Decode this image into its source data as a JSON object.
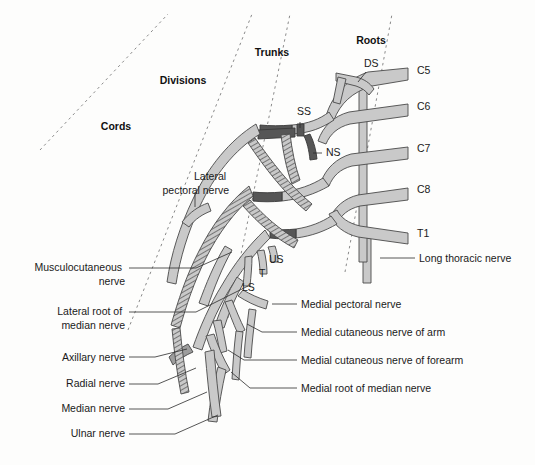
{
  "figure": {
    "colors": {
      "nerve_light": "#c9c9c9",
      "nerve_dark": "#565656",
      "nerve_mid": "#9d9d9d",
      "outline": "#4a4a4a",
      "divider": "#8a8a8a",
      "text": "#1a1a1a",
      "background": "#fdfdfc"
    }
  },
  "sections": [
    {
      "id": "cords",
      "label": "Cords",
      "x": 116,
      "y": 130
    },
    {
      "id": "divisions",
      "label": "Divisions",
      "x": 183,
      "y": 84
    },
    {
      "id": "trunks",
      "label": "Trunks",
      "x": 272,
      "y": 56
    },
    {
      "id": "roots",
      "label": "Roots",
      "x": 371,
      "y": 44
    }
  ],
  "roots": [
    {
      "id": "c5",
      "label": "C5",
      "x": 417,
      "y": 74
    },
    {
      "id": "c6",
      "label": "C6",
      "x": 417,
      "y": 110
    },
    {
      "id": "c7",
      "label": "C7",
      "x": 417,
      "y": 152
    },
    {
      "id": "c8",
      "label": "C8",
      "x": 417,
      "y": 193
    },
    {
      "id": "t1",
      "label": "T1",
      "x": 417,
      "y": 237
    }
  ],
  "abbreviations": [
    {
      "id": "ds",
      "label": "DS",
      "x": 364,
      "y": 67
    },
    {
      "id": "ss",
      "label": "SS",
      "x": 297,
      "y": 115
    },
    {
      "id": "ns",
      "label": "NS",
      "x": 326,
      "y": 156
    },
    {
      "id": "us",
      "label": "US",
      "x": 269,
      "y": 263
    },
    {
      "id": "t",
      "label": "T",
      "x": 259,
      "y": 277
    },
    {
      "id": "ls",
      "label": "LS",
      "x": 242,
      "y": 291
    }
  ],
  "labels_left": [
    {
      "id": "musculocutaneous-nerve",
      "lines": [
        "Musculocutaneous",
        "nerve"
      ],
      "x": 125,
      "y": 271,
      "align": "end",
      "leader": "M 129 268 L 196 268 L 232 252"
    },
    {
      "id": "lateral-root-of-median-nerve",
      "lines": [
        "Lateral root of",
        "median nerve"
      ],
      "x": 125,
      "y": 315,
      "align": "end",
      "leader": "M 129 312 L 196 312 L 248 286"
    },
    {
      "id": "axillary-nerve",
      "lines": [
        "Axillary nerve"
      ],
      "x": 125,
      "y": 361,
      "align": "end",
      "leader": "M 129 357 L 155 357 L 187 349"
    },
    {
      "id": "radial-nerve",
      "lines": [
        "Radial nerve"
      ],
      "x": 125,
      "y": 387,
      "align": "end",
      "leader": "M 129 384 L 158 384 L 196 368"
    },
    {
      "id": "median-nerve",
      "lines": [
        "Median nerve"
      ],
      "x": 125,
      "y": 412,
      "align": "end",
      "leader": "M 129 409 L 168 409 L 207 392"
    },
    {
      "id": "ulnar-nerve",
      "lines": [
        "Ulnar nerve"
      ],
      "x": 125,
      "y": 437,
      "align": "end",
      "leader": "M 129 434 L 175 434 L 218 415"
    }
  ],
  "labels_right": [
    {
      "id": "long-thoracic-nerve",
      "lines": [
        "Long thoracic nerve"
      ],
      "x": 419,
      "y": 262,
      "align": "start",
      "leader": "M 415 258 L 380 258"
    },
    {
      "id": "medial-pectoral-nerve",
      "lines": [
        "Medial pectoral nerve"
      ],
      "x": 301,
      "y": 308,
      "align": "start",
      "leader": "M 297 304 L 272 304"
    },
    {
      "id": "medial-cutaneous-nerve-of-arm",
      "lines": [
        "Medial cutaneous nerve of arm"
      ],
      "x": 301,
      "y": 336,
      "align": "start",
      "leader": "M 297 332 L 262 332 L 247 324"
    },
    {
      "id": "medial-cutaneous-nerve-of-forearm",
      "lines": [
        "Medial cutaneous nerve of forearm"
      ],
      "x": 301,
      "y": 364,
      "align": "start",
      "leader": "M 297 360 L 244 360 L 228 350"
    },
    {
      "id": "medial-root-of-median-nerve",
      "lines": [
        "Medial root of median nerve"
      ],
      "x": 301,
      "y": 392,
      "align": "start",
      "leader": "M 297 388 L 250 388 L 231 372"
    }
  ],
  "labels_inner": [
    {
      "id": "lateral-pectoral-nerve",
      "lines": [
        "Lateral",
        "pectoral nerve"
      ],
      "x": 229,
      "y": 180,
      "align": "end",
      "leader": "M 195 192 L 195 207"
    }
  ],
  "dividers": [
    {
      "id": "divider-cords-divisions",
      "path": "M 40 150 L 168 14"
    },
    {
      "id": "divider-divisions-trunks",
      "path": "M 128 330 L 252 14"
    },
    {
      "id": "divider-trunks-roots",
      "path": "M 228 318 L 290 14"
    },
    {
      "id": "divider-roots-edge",
      "path": "M 345 272 L 392 14"
    }
  ]
}
